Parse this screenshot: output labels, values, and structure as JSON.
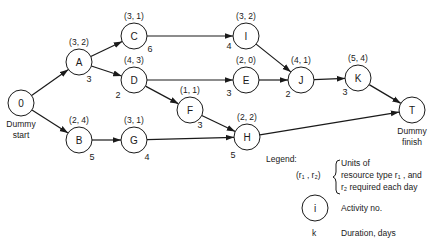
{
  "diagram": {
    "type": "activity-on-node network",
    "nodes": [
      {
        "id": "0",
        "label": "0",
        "x": 21,
        "y": 103,
        "resources": "",
        "duration": "",
        "caption": [
          "Dummy",
          "start"
        ]
      },
      {
        "id": "A",
        "label": "A",
        "x": 79,
        "y": 62,
        "resources": "(3, 2)",
        "duration": "3",
        "dur_dx": 10,
        "dur_dy": 20
      },
      {
        "id": "B",
        "label": "B",
        "x": 79,
        "y": 140,
        "resources": "(2, 4)",
        "duration": "5",
        "dur_dx": 13,
        "dur_dy": 20
      },
      {
        "id": "C",
        "label": "C",
        "x": 134,
        "y": 36,
        "resources": "(3, 1)",
        "duration": "6",
        "dur_dx": 16,
        "dur_dy": 16
      },
      {
        "id": "D",
        "label": "D",
        "x": 134,
        "y": 80,
        "resources": "(4, 3)",
        "duration": "2",
        "dur_dx": -16,
        "dur_dy": 18
      },
      {
        "id": "G",
        "label": "G",
        "x": 134,
        "y": 140,
        "resources": "(3, 1)",
        "duration": "4",
        "dur_dx": 13,
        "dur_dy": 20
      },
      {
        "id": "F",
        "label": "F",
        "x": 190,
        "y": 110,
        "resources": "(1, 1)",
        "duration": "3",
        "dur_dx": 10,
        "dur_dy": 18
      },
      {
        "id": "I",
        "label": "I",
        "x": 246,
        "y": 36,
        "resources": "(3, 2)",
        "duration": "4",
        "dur_dx": -17,
        "dur_dy": 13
      },
      {
        "id": "E",
        "label": "E",
        "x": 246,
        "y": 80,
        "resources": "(2, 0)",
        "duration": "3",
        "dur_dx": -17,
        "dur_dy": 16
      },
      {
        "id": "H",
        "label": "H",
        "x": 247,
        "y": 137,
        "resources": "(2, 2)",
        "duration": "5",
        "dur_dx": -14,
        "dur_dy": 21
      },
      {
        "id": "J",
        "label": "J",
        "x": 301,
        "y": 80,
        "resources": "(4, 1)",
        "duration": "2",
        "dur_dx": -13,
        "dur_dy": 17
      },
      {
        "id": "K",
        "label": "K",
        "x": 358,
        "y": 78,
        "resources": "(5, 4)",
        "duration": "3",
        "dur_dx": -13,
        "dur_dy": 17
      },
      {
        "id": "T",
        "label": "T",
        "x": 412,
        "y": 110,
        "resources": "",
        "duration": "",
        "caption": [
          "Dummy",
          "finish"
        ]
      }
    ],
    "edges": [
      {
        "from": "0",
        "to": "A"
      },
      {
        "from": "0",
        "to": "B"
      },
      {
        "from": "A",
        "to": "C"
      },
      {
        "from": "A",
        "to": "D"
      },
      {
        "from": "C",
        "to": "I"
      },
      {
        "from": "D",
        "to": "E"
      },
      {
        "from": "D",
        "to": "F"
      },
      {
        "from": "B",
        "to": "G"
      },
      {
        "from": "G",
        "to": "H"
      },
      {
        "from": "F",
        "to": "H"
      },
      {
        "from": "I",
        "to": "J"
      },
      {
        "from": "E",
        "to": "J"
      },
      {
        "from": "J",
        "to": "K"
      },
      {
        "from": "K",
        "to": "T"
      },
      {
        "from": "H",
        "to": "T"
      }
    ]
  },
  "legend": {
    "title": "Legend:",
    "resource_notation": "(r₁ , r₂)",
    "resource_desc": [
      "Units of",
      "resource type r₁ , and",
      "r₂ required each day"
    ],
    "node_symbol": "i",
    "node_desc": "Activity no.",
    "duration_symbol": "k",
    "duration_desc": "Duration, days"
  }
}
